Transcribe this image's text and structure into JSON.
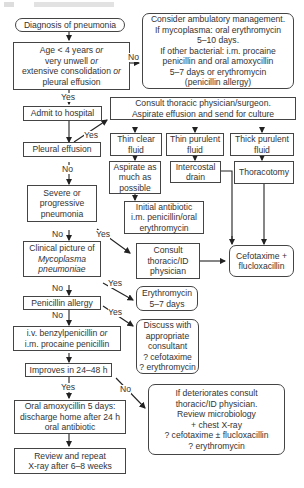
{
  "nodes": {
    "start": "Diagnosis of pneumonia",
    "criteria": {
      "line1a": "Age < 4 years ",
      "line1b": "or",
      "line2a": "very unwell ",
      "line2b": "or",
      "line3a": "extensive consolidation ",
      "line3b": "or",
      "line4": "pleural effusion"
    },
    "ambulatory": [
      "Consider ambulatory management.",
      "If mycoplasma: oral erythromycin",
      "5–10 days.",
      "If other bacterial: i.m. procaine",
      "penicillin and oral amoxycillin",
      "5–7 days or erythromycin",
      "(penicillin allergy)"
    ],
    "admit": "Admit to hospital",
    "consult_thoracic": [
      "Consult thoracic physician/surgeon.",
      "Aspirate effusion and send for culture"
    ],
    "thin_clear": [
      "Thin clear",
      "fluid"
    ],
    "thin_purulent": [
      "Thin purulent",
      "fluid"
    ],
    "thick_purulent": [
      "Thick purulent",
      "fluid"
    ],
    "aspirate": [
      "Aspirate as",
      "much as",
      "possible"
    ],
    "intercostal": [
      "Intercostal",
      "drain"
    ],
    "thoracotomy": "Thoracotomy",
    "initial_antibiotic": [
      "Initial antibiotic",
      "i.m. penicillin/oral",
      "erythromycin"
    ],
    "pleural_effusion": "Pleural effusion",
    "severe": [
      "Severe or",
      "progressive",
      "pneumonia"
    ],
    "consult_id": [
      "Consult",
      "thoracic/ID",
      "physician"
    ],
    "cefotaxime": [
      "Cefotaxime +",
      "flucloxacillin"
    ],
    "mycoplasma": {
      "line1": "Clinical picture of",
      "line2": "Mycoplasma",
      "line3": "pneumoniae"
    },
    "erythromycin": [
      "Erythromycin",
      "5–7 days"
    ],
    "penicillin_allergy": "Penicillin allergy",
    "discuss": [
      "Discuss with",
      "appropriate",
      "consultant",
      "? cefotaxime",
      "? erythromycin"
    ],
    "iv_benzyl": {
      "line1a": "i.v. benzylpenicillin ",
      "line1b": "or",
      "line2": "i.m. procaine penicillin"
    },
    "improves": "Improves in 24–48 h",
    "deteriorates": [
      "If deteriorates consult",
      "thoracic/ID physician.",
      "Review microbiology",
      "+ chest X-ray",
      "? cefotaxime ± flucloxacillin",
      "? erythromycin"
    ],
    "oral_amox": [
      "Oral amoxycillin 5 days:",
      "discharge home after 24 h",
      "oral antibiotic"
    ],
    "review": [
      "Review and repeat",
      "X-ray after 6–8 weeks"
    ]
  },
  "edge_labels": {
    "yes": "Yes",
    "no": "No"
  },
  "colors": {
    "line": "#222222",
    "border": "#444444",
    "text": "#333333"
  }
}
